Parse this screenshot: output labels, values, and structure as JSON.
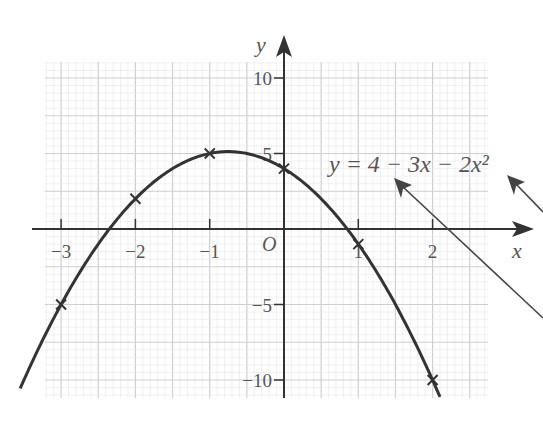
{
  "chart_data": {
    "type": "line",
    "title": "",
    "equation_label": "y = 4 − 3x − 2x²",
    "xlabel": "x",
    "ylabel": "y",
    "origin_label": "O",
    "xlim": [
      -3.3,
      2.7
    ],
    "ylim": [
      -11.2,
      11
    ],
    "x_ticks": [
      -3,
      -2,
      -1,
      1,
      2
    ],
    "x_tick_labels": [
      "−3",
      "−2",
      "−1",
      "1",
      "2"
    ],
    "y_ticks": [
      10,
      5,
      -5,
      -10
    ],
    "y_tick_labels": [
      "10",
      "5",
      "−5",
      "−10"
    ],
    "grid": true,
    "series": [
      {
        "name": "y = 4 − 3x − 2x²",
        "type": "curve",
        "x_range": [
          -3.55,
          2.1
        ]
      },
      {
        "name": "plotted points",
        "type": "scatter",
        "marker": "x",
        "x": [
          -3,
          -2,
          -1,
          0,
          1,
          2
        ],
        "y": [
          -5,
          2,
          5,
          4,
          -1,
          -10
        ]
      }
    ],
    "annotations": [
      {
        "type": "arrow",
        "note": "pointer toward equation label"
      },
      {
        "type": "arrow",
        "note": "pointer toward x² term"
      }
    ]
  },
  "colors": {
    "curve": "#333333",
    "axis": "#333333",
    "grid_major": "#cfcfcf",
    "grid_minor": "#e6e6e6",
    "text": "#555555"
  }
}
